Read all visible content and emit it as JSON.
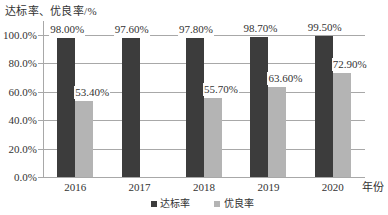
{
  "chart_data": {
    "type": "bar",
    "title": "",
    "ylabel": "达标率、优良率/%",
    "xlabel": "年份",
    "categories": [
      "2016",
      "2017",
      "2018",
      "2019",
      "2020"
    ],
    "series": [
      {
        "name": "达标率",
        "color": "#3c3c3c",
        "values": [
          98.0,
          97.6,
          97.8,
          98.7,
          99.5
        ],
        "labels": [
          "98.00%",
          "97.60%",
          "97.80%",
          "98.70%",
          "99.50%"
        ]
      },
      {
        "name": "优良率",
        "color": "#b4b4b4",
        "values": [
          53.4,
          null,
          55.7,
          63.6,
          72.9
        ],
        "labels": [
          "53.40%",
          null,
          "55.70%",
          "63.60%",
          "72.90%"
        ]
      }
    ],
    "yticks": [
      {
        "value": 0,
        "label": "0.0%"
      },
      {
        "value": 20,
        "label": "20.0%"
      },
      {
        "value": 40,
        "label": "40.0%"
      },
      {
        "value": 60,
        "label": "60.0%"
      },
      {
        "value": 80,
        "label": "80.0%"
      },
      {
        "value": 100,
        "label": "100.0%"
      }
    ],
    "ylim": [
      0,
      100
    ],
    "grid": true,
    "legend_position": "bottom"
  }
}
